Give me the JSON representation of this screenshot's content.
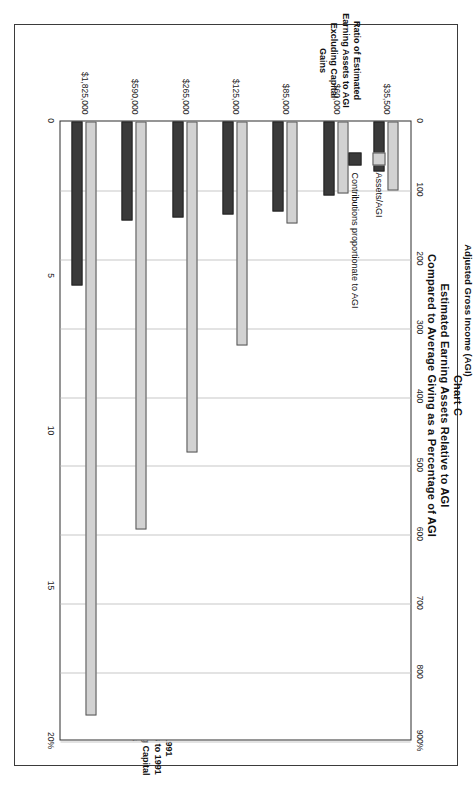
{
  "title": {
    "line1": "Chart C",
    "line2": "Estimated Earning Assets Relative to AGI",
    "line3": "Compared to Average Giving as a Percentage of AGI"
  },
  "legend": {
    "items": [
      {
        "label": "Assets/AGI",
        "color": "#d2d2d2",
        "icon": "legend-swatch-icon"
      },
      {
        "label": "Contributions proportionate to AGI",
        "color": "#3a3a3a",
        "icon": "legend-swatch-icon"
      }
    ]
  },
  "axes": {
    "primary_title": "Ratio of Estimated Earning Assets to AGI Excluding Capital Gains",
    "secondary_title": "Ratio of 1991 Contributions to 1991 AGI Excluding Capital Gains",
    "category_title": "Adjusted Gross Income (AGI)",
    "primary_ticks": [
      "0",
      "100",
      "200",
      "300",
      "400",
      "500",
      "600",
      "700",
      "800",
      "900%"
    ],
    "secondary_ticks": [
      "0",
      "5",
      "10",
      "15",
      "20%"
    ]
  },
  "chart_data": {
    "type": "bar",
    "orientation": "horizontal",
    "xlabel": "Adjusted Gross Income (AGI)",
    "ylabel": "Ratio of Estimated Earning Assets to AGI Excluding Capital Gains",
    "y2label": "Ratio of 1991 Contributions to 1991 AGI Excluding Capital Gains",
    "categories": [
      "$35,500",
      "$60,000",
      "$85,000",
      "$125,000",
      "$265,000",
      "$590,000",
      "$1,825,000"
    ],
    "ylim": [
      0,
      900
    ],
    "y2lim": [
      0,
      20
    ],
    "grid": true,
    "legend_position": "inside-right",
    "series": [
      {
        "name": "Assets/AGI",
        "axis": "primary",
        "unit": "%",
        "color": "#d2d2d2",
        "values": [
          100,
          105,
          148,
          325,
          480,
          592,
          862
        ]
      },
      {
        "name": "Contributions proportionate to AGI",
        "axis": "secondary",
        "unit": "%",
        "color": "#3a3a3a",
        "values": [
          1.6,
          2.4,
          2.9,
          3.0,
          3.1,
          3.2,
          5.3
        ]
      }
    ]
  }
}
